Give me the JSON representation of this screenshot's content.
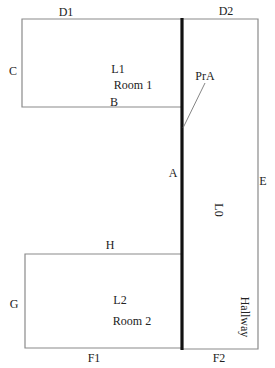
{
  "diagram": {
    "type": "floor-plan",
    "colors": {
      "thin_wall": "#8a8a8a",
      "thick_wall": "#111111",
      "text": "#222222",
      "background": "#ffffff"
    },
    "rooms": [
      {
        "id": "L1",
        "name": "Room 1"
      },
      {
        "id": "L2",
        "name": "Room 2"
      },
      {
        "id": "L0",
        "name": "Hallway"
      }
    ],
    "edge_labels": {
      "D1": "D1",
      "D2": "D2",
      "C": "C",
      "B": "B",
      "A": "A",
      "E": "E",
      "H": "H",
      "G": "G",
      "F1": "F1",
      "F2": "F2"
    },
    "annotations": {
      "pra": "PrA"
    },
    "room_labels": {
      "l1_id": "L1",
      "l1_name": "Room 1",
      "l2_id": "L2",
      "l2_name": "Room 2",
      "l0_id": "L0",
      "hallway": "Hallway"
    }
  }
}
